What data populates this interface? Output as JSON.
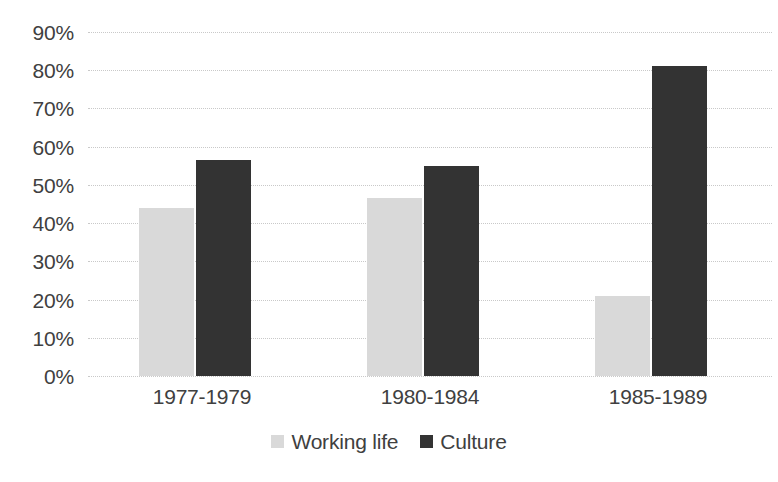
{
  "chart_data": {
    "type": "bar",
    "title": "",
    "subtitle": "",
    "xlabel": "",
    "ylabel": "",
    "categories": [
      "1977-1979",
      "1980-1984",
      "1985-1989"
    ],
    "series": [
      {
        "name": "Working life",
        "color": "#d9d9d9",
        "values": [
          44,
          46.5,
          21
        ]
      },
      {
        "name": "Culture",
        "color": "#333333",
        "values": [
          56.5,
          55,
          81
        ]
      }
    ],
    "ylim": [
      0,
      90
    ],
    "ytick_values": [
      90,
      80,
      70,
      60,
      50,
      40,
      30,
      20,
      10,
      0
    ],
    "ytick_labels": [
      "90%",
      "80%",
      "70%",
      "60%",
      "50%",
      "40%",
      "30%",
      "20%",
      "10%",
      "0%"
    ],
    "grid": true,
    "grid_style": "dotted",
    "grid_color": "#c9c9c9",
    "legend_position": "bottom",
    "background": "#ffffff",
    "text_color": "#404040"
  }
}
